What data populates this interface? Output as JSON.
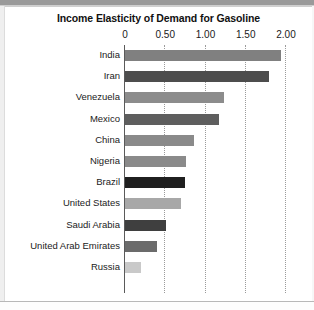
{
  "chart_data": {
    "type": "bar",
    "orientation": "horizontal",
    "title": "Income Elasticity of Demand for Gasoline",
    "xlabel": "",
    "ylabel": "",
    "xlim": [
      0,
      2.0
    ],
    "grid": true,
    "grid_style": "dotted-vertical",
    "legend": "none",
    "tick_labels": [
      "0",
      "0.50",
      "1.00",
      "1.50",
      "2.00"
    ],
    "tick_values": [
      0,
      0.5,
      1.0,
      1.5,
      2.0
    ],
    "categories": [
      "India",
      "Iran",
      "Venezuela",
      "Mexico",
      "China",
      "Nigeria",
      "Brazil",
      "United States",
      "Saudi Arabia",
      "United Arab Emirates",
      "Russia"
    ],
    "values": [
      1.94,
      1.79,
      1.23,
      1.17,
      0.86,
      0.76,
      0.74,
      0.69,
      0.51,
      0.4,
      0.2
    ],
    "bar_colors": [
      "#808080",
      "#4d4d4d",
      "#8c8c8c",
      "#5e5e5e",
      "#8a8a8a",
      "#8a8a8a",
      "#1f1f1f",
      "#a8a8a8",
      "#3f3f3f",
      "#6b6b6b",
      "#c9c9c9"
    ]
  },
  "colors": {
    "text": "#111111",
    "axis": "#5a5a5a",
    "grid": "#9b9b9b",
    "background": "#ffffff"
  }
}
